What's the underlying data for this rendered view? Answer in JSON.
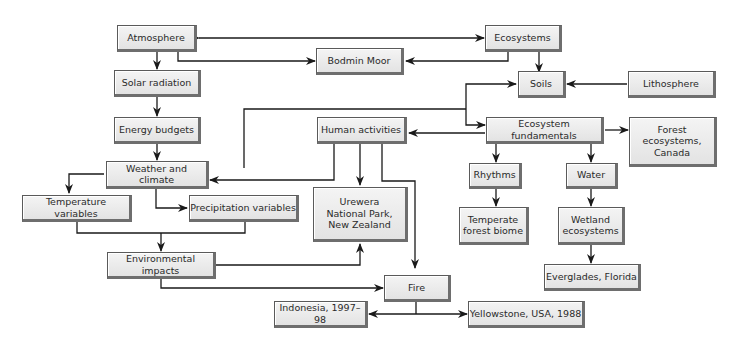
{
  "diagram": {
    "nodes": {
      "atmosphere": "Atmosphere",
      "ecosystems": "Ecosystems",
      "bodmin_moor": "Bodmin Moor",
      "solar_radiation": "Solar radiation",
      "soils": "Soils",
      "lithosphere": "Lithosphere",
      "energy_budgets": "Energy budgets",
      "human_activities": "Human activities",
      "ecosystem_fundamentals": "Ecosystem fundamentals",
      "forest_ecosystems_canada": "Forest\necosystems,\nCanada",
      "weather_and_climate": "Weather and climate",
      "rhythms": "Rhythms",
      "water": "Water",
      "temperature_variables": "Temperature variables",
      "precipitation_variables": "Precipitation variables",
      "urewera": "Urewera\nNational Park,\nNew Zealand",
      "temperate_forest_biome": "Temperate\nforest biome",
      "wetland_ecosystems": "Wetland\necosystems",
      "environmental_impacts": "Environmental impacts",
      "everglades_florida": "Everglades, Florida",
      "fire": "Fire",
      "indonesia": "Indonesia, 1997–98",
      "yellowstone": "Yellowstone, USA, 1988"
    },
    "colors": {
      "box_fill": "#ebebeb",
      "box_border": "#5a5a5a",
      "line": "#1a1a1a"
    }
  }
}
